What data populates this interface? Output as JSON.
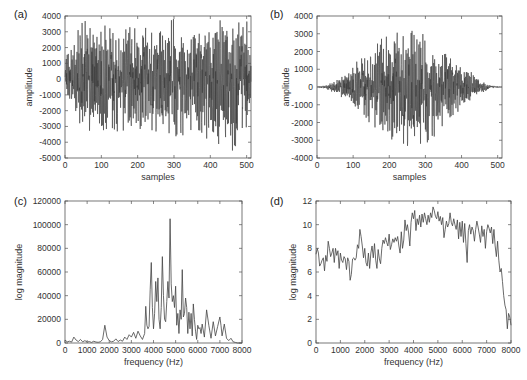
{
  "chart_data": [
    {
      "id": "a",
      "panel_label": "(a)",
      "type": "line",
      "title": "",
      "xlabel": "samples",
      "ylabel": "amplitude",
      "xlim": [
        0,
        512
      ],
      "ylim": [
        -5000,
        4000
      ],
      "xticks": [
        0,
        100,
        200,
        300,
        400,
        500
      ],
      "yticks": [
        -5000,
        -4000,
        -3000,
        -2000,
        -1000,
        0,
        1000,
        2000,
        3000,
        4000
      ],
      "grid": false,
      "description": "Dense noise-like waveform, roughly uniform envelope ±3000, peak ~3700 near sample 45, min ~-4700 near sample 450",
      "envelope": {
        "x": [
          0,
          50,
          100,
          150,
          200,
          250,
          300,
          350,
          400,
          450,
          500,
          512
        ],
        "upper": [
          1000,
          3700,
          3000,
          2500,
          3300,
          2500,
          3500,
          2500,
          3100,
          3300,
          3200,
          1500
        ],
        "lower": [
          -500,
          -2900,
          -3000,
          -2800,
          -2600,
          -3000,
          -3400,
          -3000,
          -3300,
          -4700,
          -2900,
          -1000
        ]
      },
      "frame": {
        "x0": 65,
        "y0": 16,
        "x1": 251,
        "y1": 158
      }
    },
    {
      "id": "b",
      "panel_label": "(b)",
      "type": "line",
      "title": "",
      "xlabel": "samples",
      "ylabel": "amplitude",
      "xlim": [
        0,
        512
      ],
      "ylim": [
        -4000,
        4000
      ],
      "xticks": [
        0,
        100,
        200,
        300,
        400,
        500
      ],
      "yticks": [
        -4000,
        -3000,
        -2000,
        -1000,
        0,
        1000,
        2000,
        3000,
        4000
      ],
      "grid": false,
      "description": "Windowed (tapered) version of (a); zero at ends, peak ~3400 near sample 280, min ~-3100 near sample 270",
      "envelope": {
        "x": [
          0,
          25,
          50,
          100,
          150,
          200,
          250,
          280,
          300,
          350,
          400,
          450,
          475,
          512
        ],
        "upper": [
          0,
          100,
          300,
          1100,
          1700,
          3000,
          2500,
          3400,
          2300,
          1800,
          1100,
          400,
          100,
          0
        ],
        "lower": [
          0,
          -100,
          -300,
          -900,
          -1800,
          -2400,
          -3000,
          -3100,
          -3000,
          -2000,
          -1000,
          -400,
          -100,
          0
        ]
      },
      "frame": {
        "x0": 317,
        "y0": 16,
        "x1": 502,
        "y1": 158
      }
    },
    {
      "id": "c",
      "panel_label": "(c)",
      "type": "line",
      "title": "",
      "xlabel": "frequency (Hz)",
      "ylabel": "log magnitude",
      "xlim": [
        0,
        8000
      ],
      "ylim": [
        0,
        120000
      ],
      "xticks": [
        0,
        1000,
        2000,
        3000,
        4000,
        5000,
        6000,
        7000,
        8000
      ],
      "yticks": [
        0,
        20000,
        40000,
        60000,
        80000,
        100000,
        120000
      ],
      "grid": false,
      "x": [
        0,
        100,
        200,
        300,
        400,
        500,
        600,
        700,
        800,
        900,
        1000,
        1100,
        1200,
        1300,
        1400,
        1500,
        1600,
        1700,
        1800,
        1900,
        2000,
        2100,
        2200,
        2300,
        2400,
        2500,
        2600,
        2700,
        2800,
        2900,
        3000,
        3100,
        3200,
        3300,
        3400,
        3500,
        3600,
        3650,
        3700,
        3750,
        3800,
        3850,
        3900,
        3950,
        4000,
        4050,
        4100,
        4150,
        4200,
        4250,
        4300,
        4350,
        4400,
        4450,
        4500,
        4550,
        4600,
        4650,
        4700,
        4750,
        4800,
        4850,
        4900,
        4950,
        5000,
        5050,
        5100,
        5150,
        5200,
        5250,
        5300,
        5350,
        5400,
        5450,
        5500,
        5550,
        5600,
        5650,
        5700,
        5750,
        5800,
        5850,
        5900,
        5950,
        6000,
        6050,
        6100,
        6150,
        6200,
        6300,
        6400,
        6500,
        6600,
        6700,
        6800,
        6900,
        7000,
        7050,
        7100,
        7200,
        7300,
        7400,
        7500,
        7600,
        7700,
        7800,
        8000
      ],
      "values": [
        2500,
        1000,
        1500,
        800,
        5000,
        2500,
        1200,
        3000,
        1000,
        2000,
        800,
        1200,
        500,
        1500,
        800,
        600,
        1000,
        3000,
        15000,
        5000,
        2000,
        1000,
        1500,
        3500,
        1200,
        2500,
        1500,
        5000,
        3000,
        7000,
        5000,
        9000,
        4000,
        10000,
        6000,
        3000,
        8000,
        31000,
        15000,
        12000,
        14000,
        45000,
        68000,
        30000,
        12000,
        25000,
        52000,
        35000,
        55000,
        20000,
        12000,
        30000,
        73000,
        40000,
        20000,
        18000,
        35000,
        52000,
        38000,
        105000,
        50000,
        35000,
        40000,
        30000,
        48000,
        15000,
        25000,
        8000,
        28000,
        20000,
        62000,
        22000,
        25000,
        38000,
        30000,
        8000,
        26000,
        12000,
        25000,
        6000,
        33000,
        20000,
        10000,
        3000,
        15000,
        12000,
        13000,
        8000,
        16000,
        5000,
        28000,
        15000,
        4000,
        18000,
        6000,
        14000,
        22000,
        15000,
        6000,
        16000,
        4000,
        2000,
        4000,
        1000,
        500,
        0,
        0
      ],
      "frame": {
        "x0": 65,
        "y0": 201,
        "x1": 242,
        "y1": 343
      }
    },
    {
      "id": "d",
      "panel_label": "(d)",
      "type": "line",
      "title": "",
      "xlabel": "frequency (Hz)",
      "ylabel": "log magnitude",
      "xlim": [
        0,
        8000
      ],
      "ylim": [
        0,
        12
      ],
      "xticks": [
        0,
        1000,
        2000,
        3000,
        4000,
        5000,
        6000,
        7000,
        8000
      ],
      "yticks": [
        0,
        2,
        4,
        6,
        8,
        10,
        12
      ],
      "grid": false,
      "x": [
        0,
        50,
        100,
        150,
        200,
        250,
        300,
        350,
        400,
        450,
        500,
        550,
        600,
        650,
        700,
        750,
        800,
        850,
        900,
        950,
        1000,
        1050,
        1100,
        1150,
        1200,
        1250,
        1300,
        1350,
        1400,
        1450,
        1500,
        1550,
        1600,
        1650,
        1700,
        1750,
        1800,
        1850,
        1900,
        1950,
        2000,
        2050,
        2100,
        2150,
        2200,
        2250,
        2300,
        2350,
        2400,
        2450,
        2500,
        2550,
        2600,
        2650,
        2700,
        2750,
        2800,
        2850,
        2900,
        2950,
        3000,
        3050,
        3100,
        3150,
        3200,
        3250,
        3300,
        3350,
        3400,
        3450,
        3500,
        3550,
        3600,
        3650,
        3700,
        3750,
        3800,
        3850,
        3900,
        3950,
        4000,
        4050,
        4100,
        4150,
        4200,
        4250,
        4300,
        4350,
        4400,
        4450,
        4500,
        4550,
        4600,
        4650,
        4700,
        4750,
        4800,
        4850,
        4900,
        4950,
        5000,
        5050,
        5100,
        5150,
        5200,
        5250,
        5300,
        5350,
        5400,
        5450,
        5500,
        5550,
        5600,
        5650,
        5700,
        5750,
        5800,
        5850,
        5900,
        5950,
        6000,
        6050,
        6100,
        6150,
        6200,
        6250,
        6300,
        6350,
        6400,
        6450,
        6500,
        6550,
        6600,
        6650,
        6700,
        6750,
        6800,
        6850,
        6900,
        6950,
        7000,
        7050,
        7100,
        7150,
        7200,
        7250,
        7300,
        7350,
        7400,
        7450,
        7500,
        7550,
        7600,
        7650,
        7700,
        7750,
        7800,
        7850,
        7900,
        7950,
        8000
      ],
      "values": [
        7.5,
        8.0,
        7.6,
        6.5,
        6.7,
        7.0,
        7.2,
        6.1,
        7.4,
        6.9,
        8.6,
        8.0,
        7.3,
        7.6,
        8.0,
        6.8,
        8.0,
        7.4,
        7.8,
        6.3,
        7.6,
        7.0,
        6.8,
        7.3,
        7.1,
        6.2,
        7.2,
        6.9,
        5.3,
        5.8,
        7.1,
        7.2,
        7.0,
        7.2,
        8.3,
        8.0,
        9.6,
        9.0,
        8.2,
        7.2,
        8.0,
        6.8,
        6.5,
        7.6,
        6.3,
        7.6,
        8.2,
        7.2,
        8.4,
        7.0,
        6.3,
        7.9,
        7.1,
        6.7,
        8.0,
        8.7,
        8.4,
        8.9,
        8.5,
        8.2,
        9.2,
        7.9,
        8.3,
        8.8,
        8.5,
        8.9,
        8.6,
        9.0,
        8.2,
        7.6,
        9.4,
        8.0,
        8.7,
        10.4,
        9.5,
        10.0,
        9.3,
        8.2,
        10.2,
        11.0,
        10.5,
        11.2,
        9.5,
        10.5,
        10.0,
        10.8,
        9.8,
        10.9,
        10.2,
        11.0,
        10.5,
        10.0,
        10.8,
        10.2,
        11.0,
        10.6,
        11.5,
        11.2,
        10.7,
        10.5,
        11.1,
        10.3,
        10.7,
        10.0,
        10.6,
        8.9,
        9.6,
        10.3,
        9.8,
        10.1,
        11.0,
        10.2,
        9.9,
        10.5,
        10.0,
        9.6,
        10.4,
        8.8,
        10.2,
        9.0,
        10.3,
        8.5,
        10.1,
        8.4,
        6.8,
        9.5,
        10.0,
        9.2,
        9.8,
        9.5,
        8.6,
        9.6,
        10.3,
        9.8,
        9.2,
        8.5,
        9.9,
        9.0,
        9.6,
        8.0,
        9.4,
        10.0,
        9.7,
        9.3,
        9.8,
        8.4,
        9.6,
        8.2,
        7.3,
        8.6,
        7.0,
        6.0,
        6.3,
        5.2,
        4.0,
        3.2,
        2.8,
        1.2,
        2.5,
        2.2,
        1.5
      ],
      "frame": {
        "x0": 316,
        "y0": 201,
        "x1": 511,
        "y1": 343
      }
    }
  ]
}
